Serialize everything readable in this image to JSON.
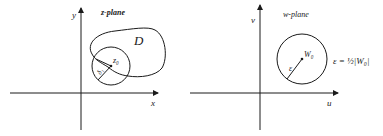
{
  "figure": {
    "left_panel": {
      "title": "z-plane",
      "x_axis_label": "x",
      "y_axis_label": "y",
      "region_label": "D",
      "center_label": "z₀",
      "radius_label": "δ₁"
    },
    "right_panel": {
      "title": "w-plane",
      "x_axis_label": "u",
      "y_axis_label": "v",
      "center_label": "W₀",
      "radius_label": "ε",
      "equation": "ε = ½|W₀|"
    }
  }
}
